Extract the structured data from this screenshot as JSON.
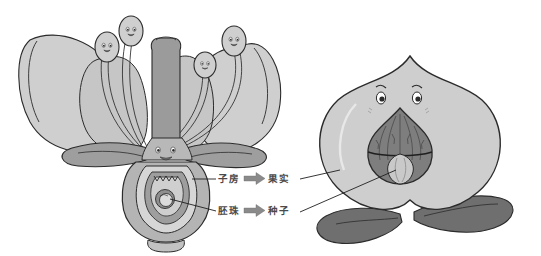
{
  "figure": {
    "labels": {
      "ovary": "子房",
      "fruit": "果实",
      "ovule": "胚珠",
      "seed": "种子"
    },
    "arrows": {
      "ovary_to_fruit": "arrow-right-block",
      "ovule_to_seed": "arrow-right-block"
    },
    "relations": [
      {
        "from": "子房",
        "to": "果实"
      },
      {
        "from": "胚珠",
        "to": "种子"
      }
    ]
  },
  "left_illustration": {
    "name": "cartoon-flower-cross-section",
    "parts": [
      {
        "name": "petal",
        "count": 4
      },
      {
        "name": "stamen-with-face",
        "count": 4
      },
      {
        "name": "pistil-style",
        "count": 1
      },
      {
        "name": "sepal",
        "count": 2
      },
      {
        "name": "ovary",
        "count": 1
      },
      {
        "name": "ovule",
        "count": 1
      },
      {
        "name": "flower-face",
        "count": 1
      },
      {
        "name": "receptacle",
        "count": 1
      }
    ]
  },
  "right_illustration": {
    "name": "cartoon-peach-cross-section",
    "parts": [
      {
        "name": "peach-flesh",
        "count": 1
      },
      {
        "name": "peach-pit",
        "count": 1
      },
      {
        "name": "peach-seed",
        "count": 1
      },
      {
        "name": "peach-face",
        "count": 1
      },
      {
        "name": "leaf",
        "count": 2
      }
    ]
  },
  "colors": {
    "background": "#ffffff",
    "outline": "#2b2b2b",
    "petal_light": "#cfcfcf",
    "petal_shade": "#bdbdbd",
    "stamen": "#c6c6c6",
    "pistil_dark": "#9b9b9b",
    "sepal": "#9e9e9e",
    "ovary_wall": "#b4b4b4",
    "ovary_inner": "#d6d6d6",
    "ovule_ring": "#8e8e8e",
    "ovule_core": "#dcdcdc",
    "peach_flesh": "#cecece",
    "peach_pit": "#7e7e7e",
    "peach_seed": "#c9c9c9",
    "leaf": "#6f6f6f",
    "label_text": "#4a4a4a",
    "arrow_fill": "#8a8a8a",
    "leader_line": "#1f1f1f"
  }
}
